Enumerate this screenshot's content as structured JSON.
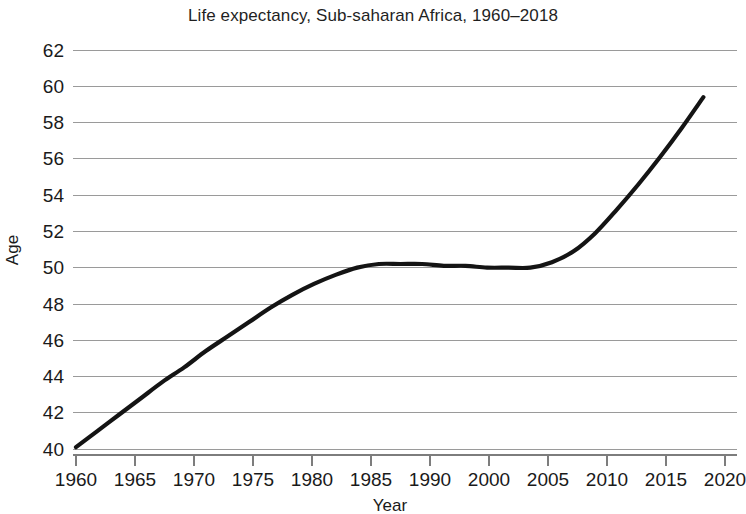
{
  "chart_data": {
    "type": "line",
    "title": "Life expectancy, Sub-saharan Africa, 1960–2018",
    "xlabel": "Year",
    "ylabel": "Age",
    "grid": "horizontal",
    "legend": "none",
    "xlim": [
      1960,
      2020
    ],
    "ylim": [
      40,
      62
    ],
    "x_tick_labels": [
      "1960",
      "1965",
      "1970",
      "1975",
      "1980",
      "1985",
      "1990",
      "2000",
      "2005",
      "2010",
      "2015",
      "2020"
    ],
    "y_tick_labels": [
      "62",
      "60",
      "58",
      "56",
      "54",
      "52",
      "50",
      "48",
      "46",
      "44",
      "42",
      "40"
    ],
    "y_ticks": [
      62,
      60,
      58,
      56,
      54,
      52,
      50,
      48,
      46,
      44,
      42,
      40
    ],
    "series": [
      {
        "name": "Life expectancy",
        "color": "#141414",
        "x": [
          1960,
          1962,
          1964,
          1966,
          1968,
          1970,
          1972,
          1974,
          1976,
          1978,
          1980,
          1982,
          1984,
          1986,
          1988,
          1990,
          1992,
          1994,
          1996,
          1998,
          2000,
          2002,
          2004,
          2006,
          2008,
          2010,
          2012,
          2014,
          2016,
          2018
        ],
        "values": [
          40.1,
          41.0,
          41.9,
          42.8,
          43.7,
          44.5,
          45.4,
          46.2,
          47.0,
          47.8,
          48.5,
          49.1,
          49.6,
          50.0,
          50.2,
          50.2,
          50.2,
          50.1,
          50.1,
          50.0,
          50.0,
          50.0,
          50.3,
          50.9,
          51.9,
          53.2,
          54.6,
          56.1,
          57.7,
          59.4
        ]
      }
    ]
  }
}
